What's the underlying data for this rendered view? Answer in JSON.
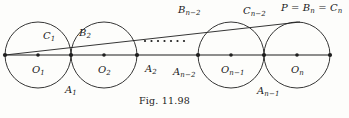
{
  "figure": {
    "caption": "Fig. 11.98",
    "stroke_color": "#1f1f1f",
    "background_color": "#fdfdfb",
    "width": 349,
    "height": 118,
    "baseline_y": 55,
    "circles": [
      {
        "name": "O_1",
        "cx": 38,
        "cy": 55,
        "r": 33,
        "center_label": "O",
        "center_sub": "1"
      },
      {
        "name": "O_2",
        "cx": 104,
        "cy": 55,
        "r": 33,
        "center_label": "O",
        "center_sub": "2"
      },
      {
        "name": "O_n-1",
        "cx": 231,
        "cy": 55,
        "r": 33,
        "center_label": "O",
        "center_sub": "n−1"
      },
      {
        "name": "O_n",
        "cx": 297,
        "cy": 55,
        "r": 33,
        "center_label": "O",
        "center_sub": "n"
      }
    ],
    "baseline": {
      "x1": 5,
      "y1": 55,
      "x2": 330,
      "y2": 55
    },
    "chord": {
      "x1": 5,
      "y1": 55,
      "x2": 300,
      "y2": 22
    },
    "ellipsis_dots": 7,
    "ellipsis": {
      "x_start": 145,
      "x_end": 184,
      "y": 41
    },
    "marked_points": [
      {
        "name": "left-end-point",
        "x": 5,
        "y": 55
      },
      {
        "name": "center-o1",
        "x": 38,
        "y": 55
      },
      {
        "name": "tangent-a1",
        "x": 71,
        "y": 55
      },
      {
        "name": "center-o2",
        "x": 104,
        "y": 55
      },
      {
        "name": "tangent-a2",
        "x": 137,
        "y": 55
      },
      {
        "name": "tangent-an-2",
        "x": 198,
        "y": 55
      },
      {
        "name": "center-on-1",
        "x": 231,
        "y": 55
      },
      {
        "name": "tangent-an-1",
        "x": 264,
        "y": 55
      },
      {
        "name": "center-on",
        "x": 297,
        "y": 55
      },
      {
        "name": "right-end-point",
        "x": 330,
        "y": 55
      }
    ],
    "labels": {
      "c1": {
        "base": "C",
        "sub": "1",
        "x": 43,
        "y": 31
      },
      "b2": {
        "base": "B",
        "sub": "2",
        "x": 79,
        "y": 28
      },
      "bn2": {
        "base": "B",
        "sub": "n−2",
        "x": 178,
        "y": 5
      },
      "cn2": {
        "base": "C",
        "sub": "n−2",
        "x": 243,
        "y": 6
      },
      "p_eq": {
        "text": "P = B",
        "sub1": "n",
        "text2": " = C",
        "sub2": "n",
        "x": 281,
        "y": 3
      },
      "o1": {
        "base": "O",
        "sub": "1",
        "x": 32,
        "y": 65
      },
      "o2": {
        "base": "O",
        "sub": "2",
        "x": 98,
        "y": 65
      },
      "on1": {
        "base": "O",
        "sub": "n−1",
        "x": 221,
        "y": 65
      },
      "on": {
        "base": "O",
        "sub": "n",
        "x": 291,
        "y": 65
      },
      "a1": {
        "base": "A",
        "sub": "1",
        "x": 65,
        "y": 85
      },
      "a2": {
        "base": "A",
        "sub": "2",
        "x": 145,
        "y": 64
      },
      "an2": {
        "base": "A",
        "sub": "n−2",
        "x": 173,
        "y": 67
      },
      "an1": {
        "base": "A",
        "sub": "n−1",
        "x": 257,
        "y": 86
      }
    }
  }
}
